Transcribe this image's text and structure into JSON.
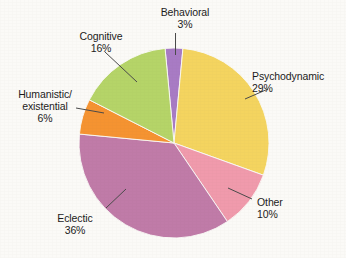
{
  "chart_data": {
    "type": "pie",
    "title": "",
    "subtitle": "",
    "xlabel": "",
    "ylabel": "",
    "legend_position": "none",
    "grid": false,
    "unit": "%",
    "total": 100,
    "categories": [
      "Behavioral",
      "Psychodynamic",
      "Other",
      "Eclectic",
      "Humanistic/existential",
      "Cognitive"
    ],
    "values": [
      3,
      29,
      10,
      36,
      6,
      16
    ],
    "slices": [
      {
        "name": "behavioral",
        "label": "Behavioral",
        "label_line2": "",
        "value": 3,
        "percent_text": "3%",
        "color": "#a87bc4",
        "start_angle": -5.4,
        "end_angle": 5.4
      },
      {
        "name": "psychodynamic",
        "label": "Psychodynamic",
        "label_line2": "",
        "value": 29,
        "percent_text": "29%",
        "color": "#f4d45f",
        "start_angle": 5.4,
        "end_angle": 109.8
      },
      {
        "name": "other",
        "label": "Other",
        "label_line2": "",
        "value": 10,
        "percent_text": "10%",
        "color": "#f09aac",
        "start_angle": 109.8,
        "end_angle": 145.8
      },
      {
        "name": "eclectic",
        "label": "Eclectic",
        "label_line2": "",
        "value": 36,
        "percent_text": "36%",
        "color": "#c07ba8",
        "start_angle": 145.8,
        "end_angle": 275.4
      },
      {
        "name": "humanistic-existential",
        "label": "Humanistic/",
        "label_line2": "existential",
        "value": 6,
        "percent_text": "6%",
        "color": "#f59331",
        "start_angle": 275.4,
        "end_angle": 297.0
      },
      {
        "name": "cognitive",
        "label": "Cognitive",
        "label_line2": "",
        "value": 16,
        "percent_text": "16%",
        "color": "#b5d468",
        "start_angle": 297.0,
        "end_angle": 354.6
      }
    ],
    "geometry": {
      "center_x": 174,
      "center_y": 143,
      "radius": 95
    },
    "colors": {
      "background": "#fbfaf7",
      "text": "#1b1b1b",
      "leader_line": "#4a4a4a"
    }
  }
}
